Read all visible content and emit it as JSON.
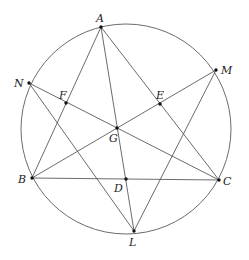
{
  "diagram": {
    "type": "geometry",
    "colors": {
      "background": "#ffffff",
      "stroke": "#5a5a5a",
      "point": "#111111",
      "label": "#222222"
    },
    "circle": {
      "cx": 126,
      "cy": 129,
      "r": 105
    },
    "points": [
      {
        "id": "A",
        "label": "A",
        "x": 101,
        "y": 27,
        "lx": 96,
        "ly": 22
      },
      {
        "id": "N",
        "label": "N",
        "x": 29,
        "y": 83,
        "lx": 14,
        "ly": 87
      },
      {
        "id": "M",
        "label": "M",
        "x": 216,
        "y": 70,
        "lx": 221,
        "ly": 74
      },
      {
        "id": "F",
        "label": "F",
        "x": 66,
        "y": 103,
        "lx": 59,
        "ly": 99
      },
      {
        "id": "E",
        "label": "E",
        "x": 160,
        "y": 104,
        "lx": 156,
        "ly": 99
      },
      {
        "id": "G",
        "label": "G",
        "x": 117,
        "y": 128,
        "lx": 109,
        "ly": 142
      },
      {
        "id": "B",
        "label": "B",
        "x": 32,
        "y": 178,
        "lx": 18,
        "ly": 183
      },
      {
        "id": "D",
        "label": "D",
        "x": 126,
        "y": 179,
        "lx": 114,
        "ly": 192
      },
      {
        "id": "C",
        "label": "C",
        "x": 219,
        "y": 180,
        "lx": 223,
        "ly": 185
      },
      {
        "id": "L",
        "label": "L",
        "x": 134,
        "y": 231,
        "lx": 129,
        "ly": 246
      }
    ],
    "segments": [
      [
        "A",
        "B"
      ],
      [
        "A",
        "C"
      ],
      [
        "A",
        "L"
      ],
      [
        "B",
        "C"
      ],
      [
        "B",
        "M"
      ],
      [
        "N",
        "C"
      ],
      [
        "N",
        "L"
      ],
      [
        "M",
        "L"
      ]
    ]
  }
}
